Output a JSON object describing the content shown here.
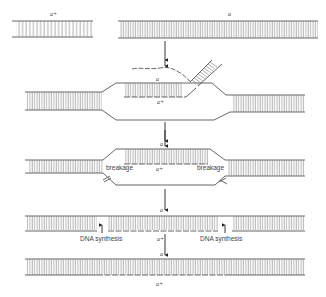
{
  "figure": {
    "colors": {
      "line": "#555555",
      "rung": "#777777",
      "text": "#444444",
      "background": "#ffffff"
    }
  },
  "steps": [
    {
      "id": "step1",
      "labels": {
        "left_duplex": "a+",
        "right_duplex": "a"
      },
      "description": "Two homologous DNA molecules: a short a+ fragment and a long a duplex"
    },
    {
      "id": "step2",
      "labels": {
        "top_strand": "a",
        "invading_strand": "a+"
      },
      "description": "Single strand from a+ invades the a duplex forming a displacement loop; displaced strand and unwinding branch shown"
    },
    {
      "id": "step3",
      "labels": {
        "top_strand": "a",
        "heteroduplex_strand": "a+",
        "breakage_left": "breakage",
        "breakage_right": "breakage"
      },
      "description": "Displaced strand is cut at both ends (breakage)"
    },
    {
      "id": "step4",
      "labels": {
        "top_strand": "a",
        "bottom_strand": "a+",
        "synthesis_left": "DNA synthesis",
        "synthesis_right": "DNA synthesis"
      },
      "description": "Gaps filled by DNA synthesis"
    },
    {
      "id": "step5",
      "labels": {
        "top_strand": "a",
        "bottom_strand": "a+"
      },
      "description": "Resulting heteroduplex a / a+"
    }
  ]
}
